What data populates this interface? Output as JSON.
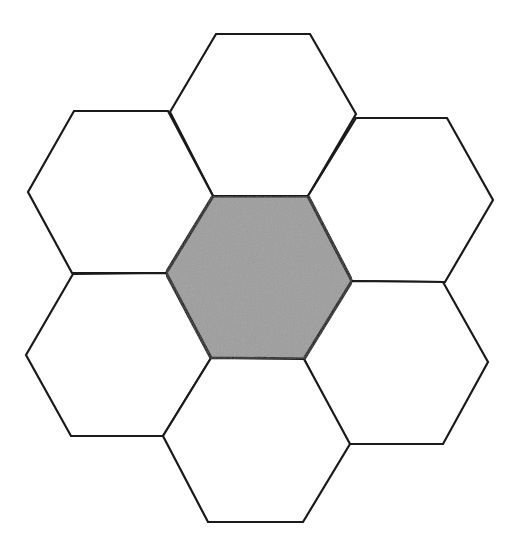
{
  "diagram": {
    "type": "hexagon-cluster",
    "colors": {
      "background": "#ffffff",
      "stroke": "#1a1a1a",
      "center_fill": "#9e9e9e",
      "outer_fill": "#ffffff"
    },
    "hexagons": [
      {
        "id": "top",
        "fill": "#ffffff",
        "points": "216,34 310,34 356,114 308,196 213,196 170,112"
      },
      {
        "id": "upper-left",
        "fill": "#ffffff",
        "points": "74,111 168,111 213,196 166,273 72,273 28,192"
      },
      {
        "id": "upper-right",
        "fill": "#ffffff",
        "points": "356,118 447,118 493,200 445,282 352,281 308,196"
      },
      {
        "id": "lower-left",
        "fill": "#ffffff",
        "points": "73,274 166,273 211,358 163,436 71,436 26,355"
      },
      {
        "id": "lower-right",
        "fill": "#ffffff",
        "points": "352,281 443,282 488,362 443,444 348,444 304,359"
      },
      {
        "id": "bottom",
        "fill": "#ffffff",
        "points": "211,358 304,359 350,444 303,522 208,522 163,436"
      },
      {
        "id": "center",
        "fill": "#9e9e9e",
        "points": "213,196 308,196 352,281 304,359 211,358 166,273"
      }
    ]
  }
}
